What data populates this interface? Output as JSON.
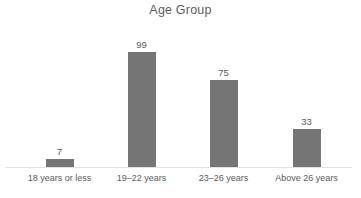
{
  "chart_data": {
    "type": "bar",
    "title": "Age Group",
    "xlabel": "",
    "ylabel": "",
    "categories": [
      "18 years or less",
      "19–22 years",
      "23–26 years",
      "Above 26 years"
    ],
    "values": [
      7,
      99,
      75,
      33
    ],
    "value_labels": [
      "7",
      "99",
      "75",
      "33"
    ],
    "ylim": [
      0,
      99
    ],
    "grid": false,
    "legend": false,
    "legend_position": "none",
    "bar_color": "#757575",
    "text_color": "#5b5b5b",
    "axis_color": "#e3e3e3",
    "background": "#ffffff",
    "series": [
      {
        "name": "Age Group",
        "values": [
          7,
          99,
          75,
          33
        ]
      }
    ]
  }
}
